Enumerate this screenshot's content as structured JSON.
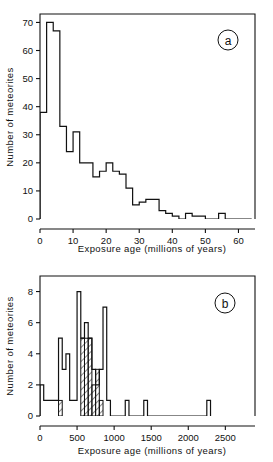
{
  "figure": {
    "background_color": "#ffffff",
    "ink_color": "#111111"
  },
  "chart_data": [
    {
      "type": "bar",
      "panel_label": "a",
      "title": "",
      "xlabel": "Exposure age (millions of years)",
      "ylabel": "Number of meteorites",
      "xlim": [
        0,
        65
      ],
      "ylim": [
        0,
        73
      ],
      "xticks": [
        0,
        10,
        20,
        30,
        40,
        50,
        60
      ],
      "xtick_labels": [
        "0",
        "10",
        "20",
        "30",
        "40",
        "50",
        "60"
      ],
      "yticks": [
        0,
        10,
        20,
        30,
        40,
        50,
        60,
        70
      ],
      "ytick_labels": [
        "0",
        "10",
        "20",
        "30",
        "40",
        "50",
        "60",
        "70"
      ],
      "grid": false,
      "legend": "none",
      "bin_width": 2,
      "bin_edges": [
        0,
        2,
        4,
        6,
        8,
        10,
        12,
        14,
        16,
        18,
        20,
        22,
        24,
        26,
        28,
        30,
        32,
        34,
        36,
        38,
        40,
        42,
        44,
        46,
        48,
        50,
        52,
        54,
        56,
        58,
        60,
        62,
        64
      ],
      "values": [
        38,
        70,
        67,
        33,
        24,
        31,
        20,
        20,
        15,
        17,
        20,
        17,
        16,
        11,
        5,
        6,
        7,
        7,
        3,
        2,
        1,
        0,
        2,
        1,
        1,
        0,
        0,
        2,
        0,
        0,
        0,
        0
      ]
    },
    {
      "type": "bar",
      "panel_label": "b",
      "title": "",
      "xlabel": "Exposure age (millions of years)",
      "ylabel": "Number of meteorites",
      "xlim": [
        0,
        2900
      ],
      "ylim": [
        0,
        9
      ],
      "xticks": [
        0,
        500,
        1000,
        1500,
        2000,
        2500
      ],
      "xtick_labels": [
        "0",
        "500",
        "1000",
        "1500",
        "2000",
        "2500"
      ],
      "yticks": [
        0,
        2,
        4,
        6,
        8
      ],
      "ytick_labels": [
        "0",
        "2",
        "4",
        "6",
        "8"
      ],
      "grid": false,
      "legend": "none",
      "bin_width": 50,
      "series": [
        {
          "name": "all meteorites",
          "style": "open",
          "bin_edges": [
            0,
            50,
            100,
            150,
            200,
            250,
            300,
            350,
            400,
            450,
            500,
            550,
            600,
            650,
            700,
            750,
            800,
            850,
            900,
            950,
            1000,
            1050,
            1100,
            1150,
            1200,
            1250,
            1300,
            1350,
            1400,
            1450,
            1500,
            2200,
            2250,
            2300
          ],
          "values": [
            2,
            1,
            1,
            1,
            1,
            5,
            3,
            4,
            1,
            1,
            8,
            5,
            6,
            5,
            3,
            2,
            3,
            7,
            1,
            0,
            0,
            0,
            0,
            1,
            0,
            0,
            0,
            0,
            1,
            0,
            0,
            0,
            1,
            0
          ]
        },
        {
          "name": "hatched subset",
          "style": "hatched",
          "bars": [
            {
              "x0": 250,
              "x1": 300,
              "value": 1
            },
            {
              "x0": 550,
              "x1": 600,
              "value": 5
            },
            {
              "x0": 600,
              "x1": 650,
              "value": 5
            },
            {
              "x0": 650,
              "x1": 700,
              "value": 5
            },
            {
              "x0": 700,
              "x1": 750,
              "value": 2
            },
            {
              "x0": 750,
              "x1": 800,
              "value": 3
            },
            {
              "x0": 800,
              "x1": 850,
              "value": 1
            }
          ]
        }
      ]
    }
  ]
}
